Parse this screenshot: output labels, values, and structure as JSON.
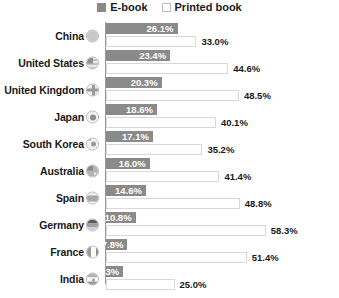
{
  "legend": {
    "position": "top-center",
    "items": [
      {
        "label": "E-book",
        "swatch": "ebook-swatch-icon",
        "color": "#8a8a8a"
      },
      {
        "label": "Printed book",
        "swatch": "printed-book-swatch-icon",
        "color": "#ffffff"
      }
    ]
  },
  "chart_data": {
    "type": "bar",
    "orientation": "horizontal",
    "title": "",
    "subtitle": "",
    "xlabel": "",
    "ylabel": "",
    "xlim": [
      0,
      60
    ],
    "grid": false,
    "legend_position": "top-center",
    "value_suffix": "%",
    "categories": [
      "China",
      "United States",
      "United Kingdom",
      "Japan",
      "South Korea",
      "Australia",
      "Spain",
      "Germany",
      "France",
      "India"
    ],
    "series": [
      {
        "name": "E-book",
        "color": "#8a8a8a",
        "values": [
          26.1,
          23.4,
          20.3,
          18.6,
          17.1,
          16.0,
          14.6,
          10.8,
          7.8,
          6.3
        ],
        "labels": [
          "26.1%",
          "23.4%",
          "20.3%",
          "18.6%",
          "17.1%",
          "16.0%",
          "14.6%",
          "10.8%",
          "7.8%",
          "6.3%"
        ]
      },
      {
        "name": "Printed book",
        "color": "#ffffff",
        "values": [
          33.0,
          44.6,
          48.5,
          40.1,
          35.2,
          41.4,
          48.8,
          58.3,
          51.4,
          25.0
        ],
        "labels": [
          "33.0%",
          "44.6%",
          "48.5%",
          "40.1%",
          "35.2%",
          "41.4%",
          "48.8%",
          "58.3%",
          "51.4%",
          "25.0%"
        ]
      }
    ],
    "flags": [
      "flag-china-icon",
      "flag-united-states-icon",
      "flag-united-kingdom-icon",
      "flag-japan-icon",
      "flag-south-korea-icon",
      "flag-australia-icon",
      "flag-spain-icon",
      "flag-germany-icon",
      "flag-france-icon",
      "flag-india-icon"
    ]
  },
  "colors": {
    "ebook_bar": "#8a8a8a",
    "printed_bar_fill": "#ffffff",
    "printed_bar_border": "#d8d8d8",
    "axis": "#9a9a9a",
    "text": "#1a1a1a",
    "inside_label": "#ffffff",
    "background": "#ffffff"
  }
}
